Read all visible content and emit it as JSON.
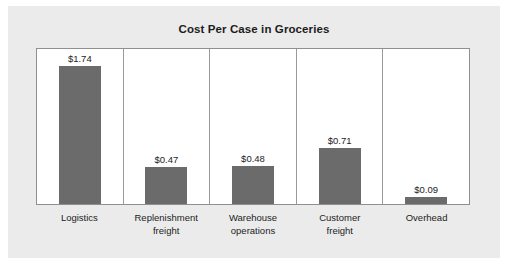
{
  "chart_data": {
    "type": "bar",
    "title": "Cost Per Case in Groceries",
    "xlabel": "",
    "ylabel": "",
    "ylim": [
      0,
      1.95
    ],
    "grid": false,
    "legend": "none",
    "categories": [
      "Logistics",
      "Replenishment freight",
      "Warehouse operations",
      "Customer freight",
      "Overhead"
    ],
    "category_lines": [
      [
        "Logistics",
        ""
      ],
      [
        "Replenishment",
        "freight"
      ],
      [
        "Warehouse",
        "operations"
      ],
      [
        "Customer",
        "freight"
      ],
      [
        "Overhead",
        ""
      ]
    ],
    "values": [
      1.74,
      0.47,
      0.48,
      0.71,
      0.09
    ],
    "value_labels": [
      "$1.74",
      "$0.47",
      "$0.48",
      "$0.71",
      "$0.09"
    ],
    "bar_color": "#6b6b6b",
    "plot_background": "#ffffff",
    "card_background": "#ebebeb",
    "axis_color": "#8f8f8f",
    "text_color": "#1c1c1c"
  }
}
